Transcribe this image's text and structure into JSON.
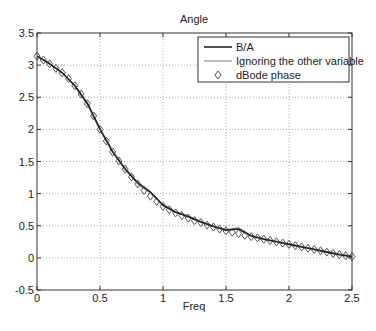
{
  "chart_data": {
    "type": "line",
    "title": "Angle",
    "xlabel": "Freq",
    "ylabel": "",
    "xlim": [
      0,
      2.5
    ],
    "ylim": [
      -0.5,
      3.5
    ],
    "xticks": [
      0,
      0.5,
      1,
      1.5,
      2,
      2.5
    ],
    "xtick_labels": [
      "0",
      "0.5",
      "1",
      "1.5",
      "2",
      "2.5"
    ],
    "yticks": [
      -0.5,
      0,
      0.5,
      1,
      1.5,
      2,
      2.5,
      3,
      3.5
    ],
    "ytick_labels": [
      "-0.5",
      "0",
      "0.5",
      "1",
      "1.5",
      "2",
      "2.5",
      "3",
      "3.5"
    ],
    "grid": true,
    "legend_position": "upper right",
    "series": [
      {
        "name": "B/A",
        "style": "line",
        "color": "#222222",
        "x": [
          0,
          0.1,
          0.2,
          0.3,
          0.4,
          0.5,
          0.6,
          0.7,
          0.8,
          0.9,
          1.0,
          1.1,
          1.2,
          1.3,
          1.4,
          1.5,
          1.6,
          1.7,
          1.8,
          1.9,
          2.0,
          2.1,
          2.2,
          2.3,
          2.4,
          2.5
        ],
        "values": [
          3.14,
          3.02,
          2.88,
          2.68,
          2.4,
          2.0,
          1.65,
          1.38,
          1.16,
          1.02,
          0.82,
          0.71,
          0.64,
          0.56,
          0.49,
          0.43,
          0.45,
          0.34,
          0.29,
          0.25,
          0.21,
          0.17,
          0.13,
          0.09,
          0.05,
          0.02
        ]
      },
      {
        "name": "Ignoring the other variable",
        "style": "line",
        "color": "#777777",
        "x": [
          0,
          0.1,
          0.2,
          0.3,
          0.4,
          0.5,
          0.6,
          0.7,
          0.8,
          0.9,
          1.0,
          1.1,
          1.2,
          1.3,
          1.4,
          1.5,
          1.6,
          1.7,
          1.8,
          1.9,
          2.0,
          2.1,
          2.2,
          2.3,
          2.4,
          2.5
        ],
        "values": [
          3.14,
          3.03,
          2.89,
          2.69,
          2.42,
          2.02,
          1.67,
          1.4,
          1.18,
          1.04,
          0.83,
          0.72,
          0.66,
          0.57,
          0.5,
          0.44,
          0.47,
          0.35,
          0.3,
          0.26,
          0.22,
          0.18,
          0.14,
          0.1,
          0.06,
          0.03
        ]
      },
      {
        "name": "dBode phase",
        "style": "marker",
        "marker": "diamond",
        "color": "#555555",
        "x": [
          0,
          0.05,
          0.1,
          0.15,
          0.2,
          0.25,
          0.3,
          0.35,
          0.4,
          0.45,
          0.5,
          0.55,
          0.6,
          0.65,
          0.7,
          0.75,
          0.8,
          0.85,
          0.9,
          0.95,
          1.0,
          1.05,
          1.1,
          1.15,
          1.2,
          1.25,
          1.3,
          1.35,
          1.4,
          1.45,
          1.5,
          1.55,
          1.6,
          1.65,
          1.7,
          1.75,
          1.8,
          1.85,
          1.9,
          1.95,
          2.0,
          2.05,
          2.1,
          2.15,
          2.2,
          2.25,
          2.3,
          2.35,
          2.4,
          2.45,
          2.5
        ],
        "values": [
          3.14,
          3.08,
          3.02,
          2.95,
          2.88,
          2.79,
          2.68,
          2.55,
          2.4,
          2.21,
          2.0,
          1.82,
          1.65,
          1.51,
          1.38,
          1.26,
          1.15,
          1.05,
          0.96,
          0.88,
          0.8,
          0.75,
          0.7,
          0.66,
          0.62,
          0.58,
          0.55,
          0.51,
          0.48,
          0.45,
          0.42,
          0.4,
          0.38,
          0.35,
          0.33,
          0.31,
          0.29,
          0.27,
          0.25,
          0.23,
          0.21,
          0.19,
          0.17,
          0.15,
          0.13,
          0.11,
          0.09,
          0.07,
          0.05,
          0.035,
          0.02
        ]
      }
    ]
  },
  "legend": {
    "items": [
      {
        "label": "B/A"
      },
      {
        "label": "Ignoring the other variable"
      },
      {
        "label": "dBode phase"
      }
    ]
  }
}
